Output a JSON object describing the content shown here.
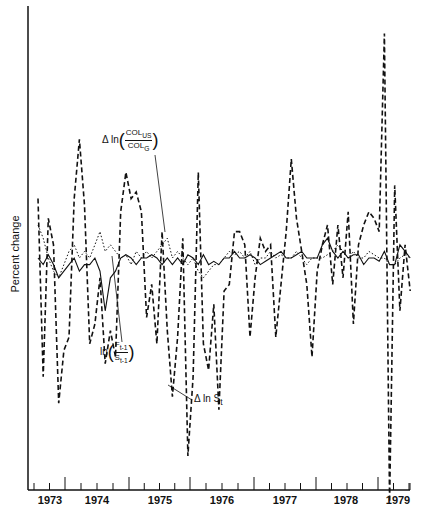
{
  "chart_data": {
    "type": "line",
    "title": "",
    "xlabel": "",
    "ylabel": "Percent change",
    "x_tick_labels": [
      "1973",
      "1974",
      "1975",
      "1976",
      "1977",
      "1978",
      "1979"
    ],
    "grid": false,
    "legend": "inline annotations",
    "series": [
      {
        "name": "Δ ln S_t",
        "style": "dashed",
        "values": [
          9,
          -18,
          6,
          2,
          -22,
          -14,
          -12,
          9,
          18,
          8,
          -13,
          -10,
          -3,
          -16,
          -11,
          -15,
          7,
          13,
          9,
          10,
          7,
          -9,
          -4,
          -13,
          4,
          -11,
          -21,
          -12,
          3,
          -30,
          -18,
          13,
          -13,
          -17,
          -7,
          -23,
          -5,
          -4,
          4,
          4,
          2,
          -12,
          -3,
          3,
          1,
          2,
          -12,
          -4,
          4,
          15,
          6,
          1,
          -4,
          -15,
          -2,
          2,
          5,
          -4,
          5,
          -3,
          7,
          -10,
          2,
          5,
          7,
          6,
          4,
          34,
          -37,
          11,
          -8,
          2,
          -5
        ]
      },
      {
        "name": "Δ ln (COL_US / COL_G)",
        "style": "solid",
        "values": [
          0,
          -1,
          0.5,
          -1,
          -3,
          -2,
          -1,
          0,
          -2,
          -1,
          -1,
          0,
          -2,
          -8,
          -3,
          -2,
          0,
          0.5,
          0,
          -1,
          0,
          0,
          0.5,
          0,
          -1,
          0,
          -1,
          0,
          -1,
          0.5,
          0,
          -1,
          0.5,
          -1,
          -0.5,
          -1,
          0,
          0,
          1,
          0,
          0,
          0.5,
          0,
          -1,
          -0.5,
          0,
          0.5,
          1,
          0,
          0,
          0.5,
          1,
          0,
          0,
          0,
          2,
          3,
          1,
          0,
          1,
          0,
          0.5,
          0.5,
          -1,
          0,
          0,
          -0.5,
          1,
          -1,
          -1,
          2,
          1,
          0
        ]
      },
      {
        "name": "ln (F_{t-1} / S_{t-1})",
        "style": "dotted",
        "values": [
          5,
          3,
          0,
          -2,
          -3,
          -1,
          1,
          2,
          0,
          1,
          0,
          2,
          4,
          1,
          2,
          1,
          0,
          0.5,
          -1,
          1,
          0,
          1,
          0,
          1,
          2,
          3,
          0,
          1,
          0,
          -1,
          0,
          -2,
          -3,
          -2,
          -1,
          -1,
          0,
          1,
          0.5,
          1,
          0,
          1,
          -1,
          0,
          0,
          1,
          0,
          0.5,
          0,
          0,
          1,
          0,
          -1,
          0,
          0,
          0,
          0.5,
          1,
          2,
          1,
          0,
          1,
          0,
          0,
          1,
          0.5,
          0,
          0,
          -1,
          -1,
          0,
          0.5,
          0
        ]
      }
    ],
    "annotations": [
      {
        "text": "Δ ln (COL_US / COL_G)",
        "points_to": "solid line"
      },
      {
        "text": "ln (F_{t-1} / S_{t-1})",
        "points_to": "dotted line"
      },
      {
        "text": "Δ ln S_t",
        "points_to": "dashed line"
      }
    ]
  },
  "axis": {
    "ylabel": "Percent change",
    "years": [
      "1973",
      "1974",
      "1975",
      "1976",
      "1977",
      "1978",
      "1979"
    ]
  },
  "labels": {
    "delta": "Δ",
    "ln": "ln",
    "col_us": "COL",
    "col_us_sub": "US",
    "col_g": "COL",
    "col_g_sub": "G",
    "f": "F",
    "f_sub": "t-1",
    "s": "S",
    "s_sub": "t-1",
    "dlns": "Δ ln S",
    "dlns_sub": "t"
  }
}
